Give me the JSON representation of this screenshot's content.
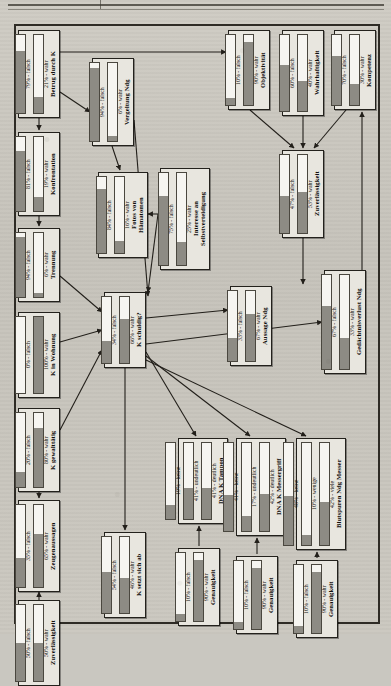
{
  "figure": {
    "kind": "bayesian-network",
    "orientation": "rotated-90-ccw",
    "edge_color": "#221f1a",
    "node_fill": "#e8e6df",
    "bar_fill": "#8d8b84"
  },
  "nodes": [
    {
      "id": "betrug-durch-k",
      "title": "Betrug durch K",
      "x": 18,
      "y": 30,
      "w": 42,
      "h": 88,
      "states": [
        {
          "label": "21% - wahr",
          "value": 21
        },
        {
          "label": "79% - falsch",
          "value": 79
        }
      ]
    },
    {
      "id": "konfrontation",
      "title": "Konfrontation",
      "x": 18,
      "y": 132,
      "w": 42,
      "h": 84,
      "states": [
        {
          "label": "19% - wahr",
          "value": 19
        },
        {
          "label": "81% - falsch",
          "value": 81
        }
      ]
    },
    {
      "id": "trennung",
      "title": "Trennung",
      "x": 18,
      "y": 228,
      "w": 42,
      "h": 74,
      "states": [
        {
          "label": "6% - wahr",
          "value": 6
        },
        {
          "label": "94% - falsch",
          "value": 94
        }
      ]
    },
    {
      "id": "k-in-wohnung",
      "title": "K in Wohnung",
      "x": 18,
      "y": 312,
      "w": 42,
      "h": 86,
      "states": [
        {
          "label": "100% - wahr",
          "value": 100
        },
        {
          "label": "0% - falsch",
          "value": 0
        }
      ]
    },
    {
      "id": "k-gewalttaetig",
      "title": "K gewalttätig",
      "x": 18,
      "y": 408,
      "w": 42,
      "h": 84,
      "states": [
        {
          "label": "80% - wahr",
          "value": 80
        },
        {
          "label": "20% - falsch",
          "value": 20
        }
      ]
    },
    {
      "id": "zeugenaussagen",
      "title": "Zeugenaussagen",
      "x": 18,
      "y": 500,
      "w": 42,
      "h": 92,
      "states": [
        {
          "label": "65% - wahr",
          "value": 65
        },
        {
          "label": "35% - falsch",
          "value": 35
        }
      ]
    },
    {
      "id": "zuverlaessigkeit-links",
      "title": "Zuverlässigkeit",
      "x": 18,
      "y": 600,
      "w": 42,
      "h": 86,
      "states": [
        {
          "label": "50% - wahr",
          "value": 50
        },
        {
          "label": "50% - falsch",
          "value": 50
        }
      ]
    },
    {
      "id": "vergeltung-ndg",
      "title": "Vergeltung Ndg",
      "x": 92,
      "y": 58,
      "w": 42,
      "h": 88,
      "states": [
        {
          "label": "6% - wahr",
          "value": 6
        },
        {
          "label": "94% - falsch",
          "value": 94
        }
      ]
    },
    {
      "id": "fotos-von-haematomen",
      "title": "Fotos von\nHämatomen",
      "x": 98,
      "y": 172,
      "w": 50,
      "h": 86,
      "states": [
        {
          "label": "16% - wahr",
          "value": 16
        },
        {
          "label": "84% - falsch",
          "value": 84
        }
      ]
    },
    {
      "id": "k-schuldig",
      "title": "K schuldig?",
      "x": 104,
      "y": 292,
      "w": 42,
      "h": 76,
      "states": [
        {
          "label": "66% - wahr",
          "value": 66
        },
        {
          "label": "34% - falsch",
          "value": 34
        }
      ]
    },
    {
      "id": "k-setzt-sich-ab",
      "title": "K setzt sich ab",
      "x": 104,
      "y": 532,
      "w": 42,
      "h": 86,
      "states": [
        {
          "label": "46% - wahr",
          "value": 46
        },
        {
          "label": "54% - falsch",
          "value": 54
        }
      ]
    },
    {
      "id": "interesse-selbstverteidigung",
      "title": "Interesse an\nSelbstverteidigung",
      "x": 160,
      "y": 168,
      "w": 50,
      "h": 102,
      "states": [
        {
          "label": "25% - wahr",
          "value": 25
        },
        {
          "label": "75% - falsch",
          "value": 75
        }
      ]
    },
    {
      "id": "dna-k-tampon",
      "title": "DNA K Tampon",
      "x": 178,
      "y": 438,
      "w": 50,
      "h": 86,
      "states": [
        {
          "label": "41% - deutlich",
          "value": 41
        },
        {
          "label": "41% - undeutlich",
          "value": 41
        },
        {
          "label": "19% - keine",
          "value": 19
        }
      ]
    },
    {
      "id": "genauigkeit-tampon",
      "title": "Genauigkeit",
      "x": 178,
      "y": 548,
      "w": 42,
      "h": 78,
      "states": [
        {
          "label": "90% - wahr",
          "value": 90
        },
        {
          "label": "10% - falsch",
          "value": 10
        }
      ]
    },
    {
      "id": "dna-k-messergriff",
      "title": "DNA K Messergriff",
      "x": 236,
      "y": 438,
      "w": 50,
      "h": 98,
      "states": [
        {
          "label": "42% - deutlich",
          "value": 42
        },
        {
          "label": "17% - undeutlich",
          "value": 17
        },
        {
          "label": "41% - keine",
          "value": 41
        }
      ]
    },
    {
      "id": "genauigkeit-messergriff",
      "title": "Genauigkeit",
      "x": 236,
      "y": 556,
      "w": 42,
      "h": 78,
      "states": [
        {
          "label": "90% - wahr",
          "value": 90
        },
        {
          "label": "10% - falsch",
          "value": 10
        }
      ]
    },
    {
      "id": "blutspuren-ndg-messer",
      "title": "Blutspuren Ndg Messer",
      "x": 296,
      "y": 438,
      "w": 50,
      "h": 112,
      "states": [
        {
          "label": "42% - viele",
          "value": 42
        },
        {
          "label": "10% - wenige",
          "value": 10
        },
        {
          "label": "48% - keine",
          "value": 48
        }
      ]
    },
    {
      "id": "genauigkeit-blut",
      "title": "Genauigkeit",
      "x": 296,
      "y": 560,
      "w": 42,
      "h": 78,
      "states": [
        {
          "label": "90% - wahr",
          "value": 90
        },
        {
          "label": "10% - falsch",
          "value": 10
        }
      ]
    },
    {
      "id": "aussage-ndg",
      "title": "Aussage Ndg",
      "x": 230,
      "y": 286,
      "w": 42,
      "h": 80,
      "states": [
        {
          "label": "67% - wahr",
          "value": 67
        },
        {
          "label": "33% - falsch",
          "value": 33
        }
      ]
    },
    {
      "id": "gedaechtnisverlust-ndg",
      "title": "Gedächtnisverlust Ndg",
      "x": 324,
      "y": 270,
      "w": 42,
      "h": 104,
      "states": [
        {
          "label": "33% - wahr",
          "value": 33
        },
        {
          "label": "67% - falsch",
          "value": 67
        }
      ]
    },
    {
      "id": "objektivitaet",
      "title": "Objektivität",
      "x": 228,
      "y": 30,
      "w": 42,
      "h": 80,
      "states": [
        {
          "label": "90% - wahr",
          "value": 90
        },
        {
          "label": "10% - falsch",
          "value": 10
        }
      ]
    },
    {
      "id": "wahrhaftigkeit",
      "title": "Wahrhaftigkeit",
      "x": 282,
      "y": 30,
      "w": 42,
      "h": 86,
      "states": [
        {
          "label": "40% - wahr",
          "value": 40
        },
        {
          "label": "60% - falsch",
          "value": 60
        }
      ]
    },
    {
      "id": "kompetenz",
      "title": "Kompetenz",
      "x": 334,
      "y": 30,
      "w": 42,
      "h": 80,
      "states": [
        {
          "label": "30% - wahr",
          "value": 30
        },
        {
          "label": "70% - falsch",
          "value": 70
        }
      ]
    },
    {
      "id": "zuverlaessigkeit-rechts",
      "title": "Zuverlässigkeit",
      "x": 282,
      "y": 150,
      "w": 42,
      "h": 88,
      "states": [
        {
          "label": "53% - wahr",
          "value": 53
        },
        {
          "label": "47% - falsch",
          "value": 47
        }
      ]
    }
  ],
  "edges": [
    {
      "from": "betrug-durch-k",
      "to": "objektivitaet",
      "path": "M 60 52 L 226 52"
    },
    {
      "from": "betrug-durch-k",
      "to": "konfrontation",
      "path": "M 39 118 L 39 130"
    },
    {
      "from": "betrug-durch-k",
      "to": "vergeltung-ndg",
      "path": "M 60 92 L 90 112"
    },
    {
      "from": "konfrontation",
      "to": "trennung",
      "path": "M 39 216 L 39 226"
    },
    {
      "from": "vergeltung-ndg",
      "to": "fotos-von-haematomen",
      "path": "M 112 146 L 120 170"
    },
    {
      "from": "vergeltung-ndg",
      "to": "k-schuldig",
      "path": "M 134 120 L 148 296"
    },
    {
      "from": "trennung",
      "to": "k-schuldig",
      "path": "M 60 276 L 102 312"
    },
    {
      "from": "k-in-wohnung",
      "to": "k-schuldig",
      "path": "M 60 342 L 102 330"
    },
    {
      "from": "k-gewalttaetig",
      "to": "zeugenaussagen",
      "path": "M 39 492 L 39 498"
    },
    {
      "from": "k-gewalttaetig",
      "to": "k-schuldig",
      "path": "M 60 430 L 102 350"
    },
    {
      "from": "zuverlaessigkeit-links",
      "to": "zeugenaussagen",
      "path": "M 39 600 L 39 592"
    },
    {
      "from": "interesse-selbstverteidigung",
      "to": "k-schuldig",
      "path": "M 158 214 L 148 292"
    },
    {
      "from": "fotos-von-haematomen",
      "to": "interesse-selbstverteidigung",
      "path": "M 158 214 L 148 214"
    },
    {
      "from": "k-schuldig",
      "to": "aussage-ndg",
      "path": "M 146 318 L 228 310"
    },
    {
      "from": "k-schuldig",
      "to": "dna-k-tampon",
      "path": "M 146 352 L 196 436"
    },
    {
      "from": "k-schuldig",
      "to": "dna-k-messergriff",
      "path": "M 146 356 L 250 436"
    },
    {
      "from": "k-schuldig",
      "to": "blutspuren-ndg-messer",
      "path": "M 146 360 L 306 436"
    },
    {
      "from": "k-schuldig",
      "to": "k-setzt-sich-ab",
      "path": "M 125 368 L 125 530"
    },
    {
      "from": "k-schuldig",
      "to": "gedaechtnisverlust-ndg",
      "path": "M 146 344 L 322 322"
    },
    {
      "from": "genauigkeit-tampon",
      "to": "dna-k-tampon",
      "path": "M 199 546 L 199 526"
    },
    {
      "from": "genauigkeit-messergriff",
      "to": "dna-k-messergriff",
      "path": "M 257 554 L 257 538"
    },
    {
      "from": "genauigkeit-blut",
      "to": "blutspuren-ndg-messer",
      "path": "M 317 558 L 317 552"
    },
    {
      "from": "zuverlaessigkeit-rechts",
      "to": "aussage-ndg",
      "path": "M 303 238 L 303 284"
    },
    {
      "from": "objektivitaet",
      "to": "zuverlaessigkeit-rechts",
      "path": "M 250 110 L 294 148"
    },
    {
      "from": "wahrhaftigkeit",
      "to": "zuverlaessigkeit-rechts",
      "path": "M 303 116 L 303 148"
    },
    {
      "from": "kompetenz",
      "to": "zuverlaessigkeit-rechts",
      "path": "M 346 110 L 314 148"
    },
    {
      "from": "aussage-ndg",
      "to": "kompetenz",
      "path": "M 362 284 L 362 112"
    }
  ]
}
